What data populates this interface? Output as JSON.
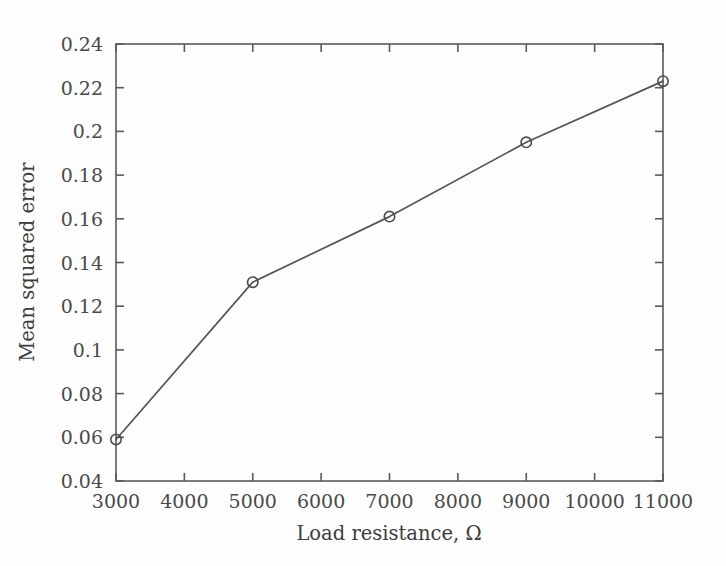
{
  "chart_data": {
    "type": "line",
    "title": "",
    "subtitle": "",
    "xlabel": "Load resistance, Ω",
    "ylabel": "Mean squared error",
    "x": [
      3000,
      5000,
      7000,
      9000,
      11000
    ],
    "values": [
      0.059,
      0.131,
      0.161,
      0.195,
      0.223
    ],
    "series": [
      {
        "name": "Mean squared error",
        "x": [
          3000,
          5000,
          7000,
          9000,
          11000
        ],
        "values": [
          0.059,
          0.131,
          0.161,
          0.195,
          0.223
        ]
      }
    ],
    "xlim": [
      3000,
      11000
    ],
    "ylim": [
      0.04,
      0.24
    ],
    "xticks": [
      3000,
      4000,
      5000,
      6000,
      7000,
      8000,
      9000,
      10000,
      11000
    ],
    "yticks": [
      0.04,
      0.06,
      0.08,
      0.1,
      0.12,
      0.14,
      0.16,
      0.18,
      0.2,
      0.22,
      0.24
    ],
    "xtick_labels": [
      "3000",
      "4000",
      "5000",
      "6000",
      "7000",
      "8000",
      "9000",
      "10000",
      "11000"
    ],
    "ytick_labels": [
      "0.04",
      "0.06",
      "0.08",
      "0.1",
      "0.12",
      "0.14",
      "0.16",
      "0.18",
      "0.2",
      "0.22",
      "0.24"
    ],
    "grid": false,
    "legend": null,
    "legend_position": "none",
    "marker": "circle-open",
    "line_color": "#555555",
    "marker_color": "#4b4b4b",
    "axis_color": "#5a5a5a",
    "background_color": "#fdfdfd",
    "annotations": []
  }
}
